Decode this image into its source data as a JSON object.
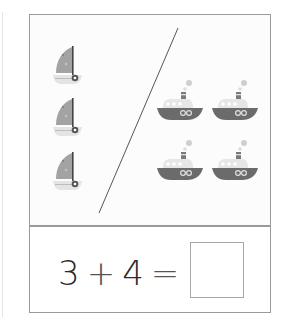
{
  "worksheet": {
    "equation": {
      "left_operand": "3",
      "operator": "+",
      "right_operand": "4",
      "equals": "=",
      "answer": ""
    },
    "groups": [
      {
        "name": "sailboats",
        "count": 3,
        "icon": "sailboat-icon"
      },
      {
        "name": "steamboats",
        "count": 4,
        "icon": "steamboat-icon"
      }
    ]
  },
  "colors": {
    "border": "#9a9a9a",
    "boat_gray": "#6b6b6b",
    "sail_gray": "#9e9e9e",
    "hull_light": "#e2e2e2",
    "text": "#2a2a2a"
  }
}
